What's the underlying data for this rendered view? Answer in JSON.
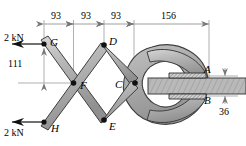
{
  "figure": {
    "colors": {
      "link_fill": "#b3b3b3",
      "link_edge": "#3a3a3a",
      "ring_fill": "#a8a8a8",
      "bar_fill": "#b5b5b5",
      "dim_line": "#777777",
      "pivot": "#111111"
    }
  },
  "dimensions": {
    "top": [
      {
        "label": "93",
        "value": 93,
        "unit": "mm"
      },
      {
        "label": "93",
        "value": 93,
        "unit": "mm"
      },
      {
        "label": "93",
        "value": 93,
        "unit": "mm"
      },
      {
        "label": "156",
        "value": 156,
        "unit": "mm"
      }
    ],
    "left": {
      "label": "111",
      "value": 111,
      "unit": "mm"
    },
    "right": {
      "label": "36",
      "value": 36,
      "unit": "mm"
    }
  },
  "forces": [
    {
      "id": "force-top",
      "label": "2 kN",
      "magnitude": 2,
      "unit": "kN",
      "direction": "left",
      "at": "G"
    },
    {
      "id": "force-bottom",
      "label": "2 kN",
      "magnitude": 2,
      "unit": "kN",
      "direction": "left",
      "at": "H"
    }
  ],
  "points": [
    {
      "id": "A",
      "label": "A"
    },
    {
      "id": "B",
      "label": "B"
    },
    {
      "id": "C",
      "label": "C"
    },
    {
      "id": "D",
      "label": "D"
    },
    {
      "id": "E",
      "label": "E"
    },
    {
      "id": "F",
      "label": "F"
    },
    {
      "id": "G",
      "label": "G"
    },
    {
      "id": "H",
      "label": "H"
    }
  ]
}
